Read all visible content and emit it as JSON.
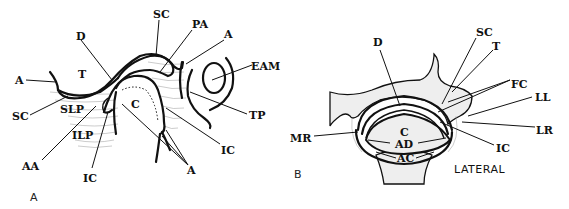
{
  "panel_a": {
    "panel_label": "A",
    "labels": {
      "D": "D",
      "SC_top": "SC",
      "PA": "PA",
      "A_top": "A",
      "EAM": "EAM",
      "A_left": "A",
      "T": "T",
      "SC_left": "SC",
      "SLP": "SLP",
      "ILP": "ILP",
      "C": "C",
      "TP": "TP",
      "IC_right": "IC",
      "AA": "AA",
      "IC_bottom": "IC",
      "A_bottom": "A"
    }
  },
  "panel_b": {
    "panel_label": "B",
    "labels": {
      "D": "D",
      "SC": "SC",
      "T": "T",
      "FC": "FC",
      "LL": "LL",
      "MR": "MR",
      "C": "C",
      "AD": "AD",
      "AC": "AC",
      "LR": "LR",
      "IC": "IC"
    },
    "orientation": "LATERAL"
  }
}
